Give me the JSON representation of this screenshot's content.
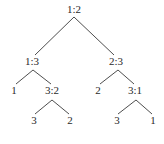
{
  "diagram": {
    "type": "tree",
    "colors": {
      "text": "#2a2a2a",
      "edge": "#3a3a3a",
      "background": "#ffffff"
    },
    "nodes": [
      {
        "id": "n0",
        "label": "1:2",
        "x": 74,
        "y": 13
      },
      {
        "id": "n1",
        "label": "1:3",
        "x": 32,
        "y": 65
      },
      {
        "id": "n2",
        "label": "2:3",
        "x": 116,
        "y": 65
      },
      {
        "id": "n3",
        "label": "1",
        "x": 14,
        "y": 94
      },
      {
        "id": "n4",
        "label": "3:2",
        "x": 52,
        "y": 94
      },
      {
        "id": "n5",
        "label": "2",
        "x": 98,
        "y": 94
      },
      {
        "id": "n6",
        "label": "3:1",
        "x": 135,
        "y": 94
      },
      {
        "id": "n7",
        "label": "3",
        "x": 34,
        "y": 124
      },
      {
        "id": "n8",
        "label": "2",
        "x": 70,
        "y": 124
      },
      {
        "id": "n9",
        "label": "3",
        "x": 117,
        "y": 124
      },
      {
        "id": "n10",
        "label": "1",
        "x": 153,
        "y": 124
      }
    ],
    "edges": [
      {
        "from": "n0",
        "to": "n1",
        "x1": 74,
        "y1": 17,
        "x2": 35,
        "y2": 55
      },
      {
        "from": "n0",
        "to": "n2",
        "x1": 74,
        "y1": 17,
        "x2": 114,
        "y2": 55
      },
      {
        "from": "n1",
        "to": "n3",
        "x1": 33,
        "y1": 70,
        "x2": 16,
        "y2": 84
      },
      {
        "from": "n1",
        "to": "n4",
        "x1": 33,
        "y1": 70,
        "x2": 51,
        "y2": 84
      },
      {
        "from": "n2",
        "to": "n5",
        "x1": 118,
        "y1": 70,
        "x2": 100,
        "y2": 84
      },
      {
        "from": "n2",
        "to": "n6",
        "x1": 118,
        "y1": 70,
        "x2": 134,
        "y2": 84
      },
      {
        "from": "n4",
        "to": "n7",
        "x1": 52,
        "y1": 100,
        "x2": 35,
        "y2": 114
      },
      {
        "from": "n4",
        "to": "n8",
        "x1": 52,
        "y1": 100,
        "x2": 69,
        "y2": 114
      },
      {
        "from": "n6",
        "to": "n9",
        "x1": 136,
        "y1": 100,
        "x2": 118,
        "y2": 114
      },
      {
        "from": "n6",
        "to": "n10",
        "x1": 136,
        "y1": 100,
        "x2": 152,
        "y2": 114
      }
    ]
  }
}
